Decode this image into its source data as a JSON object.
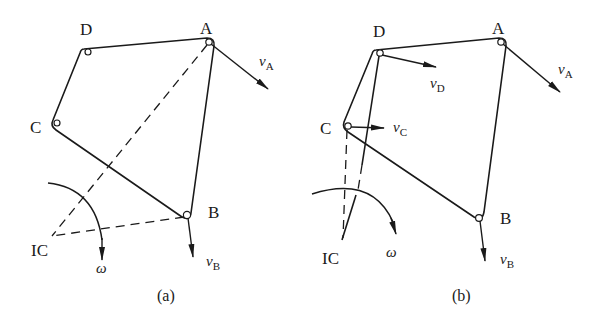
{
  "figure": {
    "panels": [
      {
        "id": "a",
        "caption": "(a)",
        "points": {
          "A": {
            "label": "A",
            "x": 209,
            "y": 42
          },
          "B": {
            "label": "B",
            "x": 187,
            "y": 215
          },
          "C": {
            "label": "C",
            "x": 56,
            "y": 125
          },
          "D": {
            "label": "D",
            "x": 88,
            "y": 52
          },
          "IC": {
            "label": "IC",
            "x": 52,
            "y": 236
          }
        },
        "velocities": [
          {
            "name": "vA",
            "symbol": "v",
            "subscript": "A",
            "from": "A"
          },
          {
            "name": "vB",
            "symbol": "v",
            "subscript": "B",
            "from": "B"
          }
        ],
        "angular_velocity": {
          "symbol": "ω"
        }
      },
      {
        "id": "b",
        "caption": "(b)",
        "points": {
          "A": {
            "label": "A",
            "x": 501,
            "y": 42
          },
          "B": {
            "label": "B",
            "x": 479,
            "y": 218
          },
          "C": {
            "label": "C",
            "x": 348,
            "y": 126
          },
          "D": {
            "label": "D",
            "x": 380,
            "y": 53
          },
          "IC": {
            "label": "IC",
            "x": 342,
            "y": 240
          }
        },
        "velocities": [
          {
            "name": "vA",
            "symbol": "v",
            "subscript": "A",
            "from": "A"
          },
          {
            "name": "vB",
            "symbol": "v",
            "subscript": "B",
            "from": "B"
          },
          {
            "name": "vC",
            "symbol": "v",
            "subscript": "C",
            "from": "C"
          },
          {
            "name": "vD",
            "symbol": "v",
            "subscript": "D",
            "from": "D"
          }
        ],
        "angular_velocity": {
          "symbol": "ω"
        }
      }
    ]
  },
  "labels": {
    "a": {
      "A": "A",
      "B": "B",
      "C": "C",
      "D": "D",
      "IC": "IC",
      "v": "v",
      "vA_sub": "A",
      "vB_sub": "B",
      "omega": "ω",
      "caption": "(a)"
    },
    "b": {
      "A": "A",
      "B": "B",
      "C": "C",
      "D": "D",
      "IC": "IC",
      "v": "v",
      "vA_sub": "A",
      "vB_sub": "B",
      "vC_sub": "C",
      "vD_sub": "D",
      "omega": "ω",
      "caption": "(b)"
    }
  }
}
